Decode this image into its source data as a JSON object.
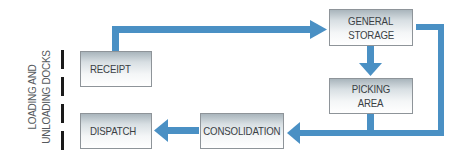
{
  "diagram": {
    "type": "warehouse-flow",
    "colors": {
      "arrow": "#4a90c4",
      "box_border": "#8e9499",
      "box_text": "#3a3f44",
      "dock_marker": "#1a1a1a",
      "label_text": "#55595d"
    },
    "dock_label": {
      "line1": "LOADING AND",
      "line2": "UNLOADING DOCKS"
    },
    "nodes": {
      "receipt": {
        "label": "RECEIPT"
      },
      "general_storage": {
        "line1": "GENERAL",
        "line2": "STORAGE"
      },
      "picking_area": {
        "line1": "PICKING",
        "line2": "AREA"
      },
      "consolidation": {
        "label": "CONSOLIDATION"
      },
      "dispatch": {
        "label": "DISPATCH"
      }
    },
    "edges": [
      {
        "from": "RECEIPT",
        "to": "GENERAL STORAGE"
      },
      {
        "from": "GENERAL STORAGE",
        "to": "PICKING AREA"
      },
      {
        "from": "GENERAL STORAGE",
        "to": "CONSOLIDATION"
      },
      {
        "from": "PICKING AREA",
        "to": "CONSOLIDATION"
      },
      {
        "from": "CONSOLIDATION",
        "to": "DISPATCH"
      }
    ]
  }
}
